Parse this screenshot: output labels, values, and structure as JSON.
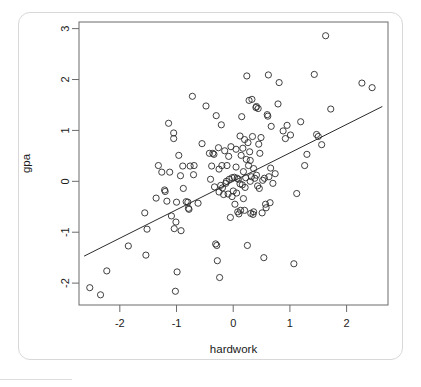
{
  "chart_data": {
    "type": "scatter",
    "title": "",
    "xlabel": "hardwork",
    "ylabel": "gpa",
    "xlim": [
      -2.72,
      2.73
    ],
    "ylim": [
      -2.43,
      3.13
    ],
    "xticks": [
      -2,
      -1,
      0,
      1,
      2
    ],
    "xtick_labels": [
      "-2",
      "-1",
      "0",
      "1",
      "2"
    ],
    "yticks": [
      -2,
      -1,
      0,
      1,
      2,
      3
    ],
    "ytick_labels": [
      "-2",
      "-1",
      "0",
      "1",
      "2",
      "3"
    ],
    "grid": false,
    "legend": null,
    "marker": "open-circle",
    "marker_color": "#2b2b2b",
    "frame_color": "#6b6b6b",
    "background": "#ffffff",
    "fit_line": {
      "type": "linear-regression",
      "slope": 0.559,
      "intercept": 0.0,
      "x_start": -2.63,
      "y_start": -1.47,
      "x_end": 2.63,
      "y_end": 1.47,
      "color": "#2b2b2b"
    },
    "n_points": 150,
    "points": [
      [
        -2.53,
        -2.09
      ],
      [
        -2.34,
        -2.23
      ],
      [
        -2.23,
        -1.76
      ],
      [
        -1.85,
        -1.27
      ],
      [
        -1.56,
        -0.62
      ],
      [
        -1.54,
        -1.45
      ],
      [
        -1.52,
        -0.94
      ],
      [
        -1.36,
        -0.33
      ],
      [
        -1.32,
        0.31
      ],
      [
        -1.26,
        0.18
      ],
      [
        -1.21,
        -0.17
      ],
      [
        -1.2,
        -0.2
      ],
      [
        -1.17,
        -0.39
      ],
      [
        -1.14,
        1.14
      ],
      [
        -1.12,
        0.18
      ],
      [
        -1.09,
        -0.68
      ],
      [
        -1.05,
        0.95
      ],
      [
        -1.05,
        0.84
      ],
      [
        -1.04,
        -0.93
      ],
      [
        -1.02,
        -2.16
      ],
      [
        -1.01,
        -0.8
      ],
      [
        -0.99,
        -1.78
      ],
      [
        -0.96,
        0.51
      ],
      [
        -0.93,
        0.11
      ],
      [
        -0.92,
        -0.97
      ],
      [
        -0.89,
        0.3
      ],
      [
        -0.88,
        -0.14
      ],
      [
        -0.83,
        -0.4
      ],
      [
        -0.8,
        -0.41
      ],
      [
        -0.79,
        -0.53
      ],
      [
        -0.78,
        -0.55
      ],
      [
        -0.76,
        0.3
      ],
      [
        -0.72,
        1.67
      ],
      [
        -0.69,
        0.31
      ],
      [
        -0.62,
        -0.43
      ],
      [
        -0.55,
        0.74
      ],
      [
        -0.48,
        1.48
      ],
      [
        -0.42,
        0.55
      ],
      [
        -0.4,
        0.04
      ],
      [
        -0.38,
        0.3
      ],
      [
        -0.36,
        0.55
      ],
      [
        -0.34,
        0.53
      ],
      [
        -0.33,
        -0.11
      ],
      [
        -0.31,
        -1.23
      ],
      [
        -0.3,
        1.29
      ],
      [
        -0.29,
        -1.26
      ],
      [
        -0.28,
        -1.56
      ],
      [
        -0.26,
        0.66
      ],
      [
        -0.25,
        -0.21
      ],
      [
        -0.24,
        -1.89
      ],
      [
        -0.22,
        -0.08
      ],
      [
        -0.21,
        1.11
      ],
      [
        -0.2,
        0.31
      ],
      [
        -0.19,
        -0.13
      ],
      [
        -0.17,
        -0.26
      ],
      [
        -0.15,
        0.6
      ],
      [
        -0.13,
        -0.04
      ],
      [
        -0.12,
        0.0
      ],
      [
        -0.11,
        0.31
      ],
      [
        -0.09,
        -0.25
      ],
      [
        -0.07,
        0.04
      ],
      [
        -0.05,
        -0.71
      ],
      [
        -0.04,
        0.68
      ],
      [
        -0.02,
        0.07
      ],
      [
        0.0,
        -0.19
      ],
      [
        0.02,
        0.08
      ],
      [
        0.03,
        -0.45
      ],
      [
        0.05,
        0.63
      ],
      [
        0.06,
        -0.23
      ],
      [
        0.07,
        0.06
      ],
      [
        0.08,
        -0.6
      ],
      [
        0.09,
        0.04
      ],
      [
        0.1,
        -0.64
      ],
      [
        0.12,
        0.89
      ],
      [
        0.13,
        -0.57
      ],
      [
        0.14,
        0.51
      ],
      [
        0.15,
        1.27
      ],
      [
        0.16,
        -0.07
      ],
      [
        0.17,
        0.65
      ],
      [
        0.18,
        0.19
      ],
      [
        0.2,
        -0.57
      ],
      [
        0.21,
        -0.12
      ],
      [
        0.22,
        0.07
      ],
      [
        0.23,
        0.43
      ],
      [
        0.24,
        2.07
      ],
      [
        0.25,
        -1.26
      ],
      [
        0.26,
        0.76
      ],
      [
        0.27,
        0.31
      ],
      [
        0.28,
        1.59
      ],
      [
        0.29,
        0.58
      ],
      [
        0.3,
        0.0
      ],
      [
        0.31,
        -0.63
      ],
      [
        0.32,
        0.09
      ],
      [
        0.33,
        1.61
      ],
      [
        0.34,
        0.88
      ],
      [
        0.35,
        -0.65
      ],
      [
        0.36,
        0.25
      ],
      [
        0.38,
        0.06
      ],
      [
        0.4,
        1.45
      ],
      [
        0.41,
        1.47
      ],
      [
        0.43,
        -0.09
      ],
      [
        0.44,
        1.43
      ],
      [
        0.45,
        0.73
      ],
      [
        0.46,
        -0.14
      ],
      [
        0.47,
        0.55
      ],
      [
        0.49,
        0.86
      ],
      [
        0.51,
        -0.62
      ],
      [
        0.52,
        0.02
      ],
      [
        0.54,
        -1.5
      ],
      [
        0.55,
        0.06
      ],
      [
        0.57,
        -0.45
      ],
      [
        0.58,
        -0.52
      ],
      [
        0.6,
        1.31
      ],
      [
        0.61,
        1.28
      ],
      [
        0.62,
        2.09
      ],
      [
        0.63,
        0.09
      ],
      [
        0.65,
        -0.42
      ],
      [
        0.67,
        1.08
      ],
      [
        0.7,
        -0.04
      ],
      [
        0.74,
        0.15
      ],
      [
        0.79,
        1.52
      ],
      [
        0.81,
        1.94
      ],
      [
        0.88,
        0.99
      ],
      [
        0.92,
        0.84
      ],
      [
        0.95,
        1.1
      ],
      [
        1.01,
        0.91
      ],
      [
        1.07,
        -1.62
      ],
      [
        1.12,
        -0.24
      ],
      [
        1.19,
        1.17
      ],
      [
        1.26,
        0.31
      ],
      [
        1.3,
        0.53
      ],
      [
        1.43,
        2.1
      ],
      [
        1.47,
        0.92
      ],
      [
        1.5,
        0.88
      ],
      [
        1.56,
        0.72
      ],
      [
        1.63,
        2.86
      ],
      [
        1.72,
        1.42
      ],
      [
        2.27,
        1.93
      ],
      [
        2.45,
        1.84
      ],
      [
        -1.0,
        -0.41
      ],
      [
        -0.7,
        0.13
      ],
      [
        0.3,
        0.41
      ],
      [
        0.36,
        -0.6
      ],
      [
        0.18,
        -0.34
      ],
      [
        0.05,
        0.28
      ],
      [
        -0.08,
        0.49
      ],
      [
        0.12,
        -0.05
      ],
      [
        0.41,
        0.12
      ],
      [
        -0.02,
        -0.3
      ],
      [
        0.2,
        0.82
      ],
      [
        -0.25,
        0.24
      ],
      [
        0.66,
        0.26
      ]
    ]
  }
}
